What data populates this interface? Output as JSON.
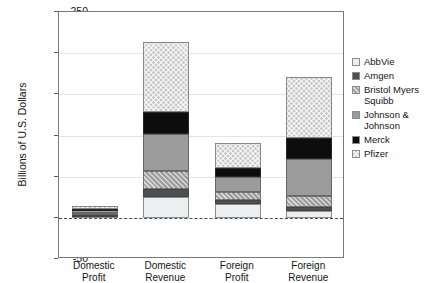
{
  "chart_data": {
    "type": "bar",
    "subtype": "stacked-vertical",
    "title": "",
    "subtitle": "",
    "xlabel": "",
    "ylabel": "Billions of U.S. Dollars",
    "ylim": [
      -50,
      250
    ],
    "ytick_values": [
      -50,
      0,
      50,
      100,
      150,
      200,
      250
    ],
    "ytick_labels": [
      "-50",
      "0",
      "50",
      "100",
      "150",
      "200",
      "250"
    ],
    "grid": true,
    "grid_axis": "y",
    "zero_line": true,
    "legend_position": "right",
    "categories": [
      "Domestic Profit",
      "Domestic Revenue",
      "Foreign Profit",
      "Foreign Revenue"
    ],
    "category_labels_wrapped": [
      [
        "Domestic",
        "Profit"
      ],
      [
        "Domestic",
        "Revenue"
      ],
      [
        "Foreign",
        "Profit"
      ],
      [
        "Foreign",
        "Revenue"
      ]
    ],
    "series": [
      {
        "name": "AbbVie",
        "key": "abbvie",
        "color": "#eceff1",
        "pattern": "solid-light",
        "values": [
          2,
          25,
          17,
          8
        ]
      },
      {
        "name": "Amgen",
        "key": "amgen",
        "color": "#4f4f4f",
        "pattern": "solid-dark",
        "values": [
          2,
          10,
          5,
          5
        ]
      },
      {
        "name": "Bristol Myers Squibb",
        "key": "bms",
        "color": "#9e9e9e",
        "pattern": "diagonal-hatch",
        "values": [
          2,
          22,
          9,
          14
        ]
      },
      {
        "name": "Johnson & Johnson",
        "key": "jnj",
        "color": "#9b9b9b",
        "pattern": "solid-mid",
        "values": [
          3,
          45,
          18,
          45
        ]
      },
      {
        "name": "Merck",
        "key": "merck",
        "color": "#0d0d0d",
        "pattern": "solid-black",
        "values": [
          2,
          27,
          12,
          25
        ]
      },
      {
        "name": "Pfizer",
        "key": "pfizer",
        "color": "#c9c9c9",
        "pattern": "cross-hatch",
        "values": [
          3,
          84,
          30,
          74
        ]
      }
    ],
    "totals": [
      14,
      213,
      91,
      171
    ]
  },
  "legend": {
    "entries": [
      {
        "label": "AbbVie"
      },
      {
        "label": "Amgen"
      },
      {
        "label": "Bristol Myers\nSquibb"
      },
      {
        "label": "Johnson &\nJohnson"
      },
      {
        "label": "Merck"
      },
      {
        "label": "Pfizer"
      }
    ]
  },
  "axes": {
    "y_title": "Billions of U.S. Dollars"
  },
  "colors": {
    "frame": "#7a7a7a",
    "grid": "#e4e4e4",
    "zero_line": "#4a4a4a",
    "text": "#141414",
    "background": "#ffffff"
  }
}
